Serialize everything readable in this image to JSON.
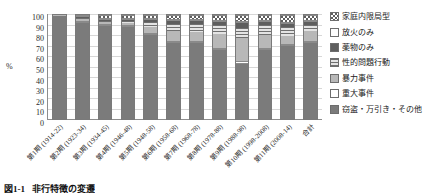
{
  "chart_data": {
    "type": "bar",
    "subtype": "stacked-percentage",
    "title": "",
    "xlabel": "",
    "ylabel": "%",
    "ylim": [
      0,
      100
    ],
    "ytick_step": 10,
    "grid": true,
    "legend_position": "right",
    "categories": [
      "第1期 (1914-22)",
      "第2期 (1923-34)",
      "第3期 (1934-45)",
      "第4期 (1946-48)",
      "第5期 (1948-58)",
      "第6期 (1958-68)",
      "第7期 (1968-78)",
      "第8期 (1978-88)",
      "第9期 (1988-98)",
      "第10期 (1998-2008)",
      "第11期 (2008-14)",
      "合計"
    ],
    "yticks": [
      "100",
      "90",
      "80",
      "70",
      "60",
      "50",
      "40",
      "30",
      "20",
      "10",
      "0"
    ],
    "series": [
      {
        "name": "窃盗・万引き・その他",
        "key": "other",
        "color": "#7b7b7b",
        "values": [
          99,
          94,
          91,
          90,
          82,
          74,
          74,
          67,
          53,
          66,
          71,
          74
        ]
      },
      {
        "name": "重大事件",
        "key": "serious",
        "color": "#ffffff",
        "values": [
          0,
          1,
          1,
          1,
          1,
          1,
          1,
          1,
          3,
          2,
          1,
          1
        ]
      },
      {
        "name": "暴力事件",
        "key": "violence",
        "color": "#b8b8b8",
        "values": [
          1,
          2,
          2,
          2,
          6,
          10,
          9,
          14,
          22,
          13,
          8,
          9
        ]
      },
      {
        "name": "性的問題行動",
        "key": "sexual",
        "color": "#6f6f6f",
        "values": [
          0,
          1,
          1,
          2,
          5,
          7,
          8,
          8,
          10,
          9,
          8,
          6
        ]
      },
      {
        "name": "薬物のみ",
        "key": "drug",
        "color": "#5e5e5e",
        "values": [
          0,
          1,
          1,
          1,
          2,
          3,
          3,
          3,
          4,
          3,
          3,
          3
        ]
      },
      {
        "name": "放火のみ",
        "key": "arson",
        "color": "#fdfdfd",
        "values": [
          0,
          1,
          1,
          1,
          1,
          1,
          1,
          2,
          2,
          2,
          2,
          2
        ]
      },
      {
        "name": "家庭内限局型",
        "key": "domestic",
        "color": "#ffffff",
        "values": [
          0,
          0,
          3,
          3,
          3,
          4,
          4,
          5,
          6,
          5,
          7,
          5
        ]
      }
    ]
  },
  "legend": {
    "items": [
      {
        "label": "家庭内限局型",
        "key": "domestic",
        "swatch": "dotted-swatch"
      },
      {
        "label": "放火のみ",
        "key": "arson",
        "swatch": "white-swatch"
      },
      {
        "label": "薬物のみ",
        "key": "drug",
        "swatch": "dark-gray-swatch"
      },
      {
        "label": "性的問題行動",
        "key": "sexual",
        "swatch": "striped-swatch"
      },
      {
        "label": "暴力事件",
        "key": "violence",
        "swatch": "light-gray-swatch"
      },
      {
        "label": "重大事件",
        "key": "serious",
        "swatch": "white-swatch"
      },
      {
        "label": "窃盗・万引き・その他",
        "key": "other",
        "swatch": "medium-gray-swatch"
      }
    ]
  },
  "caption": {
    "number": "図1-1",
    "text": "非行特徴の変遷"
  }
}
